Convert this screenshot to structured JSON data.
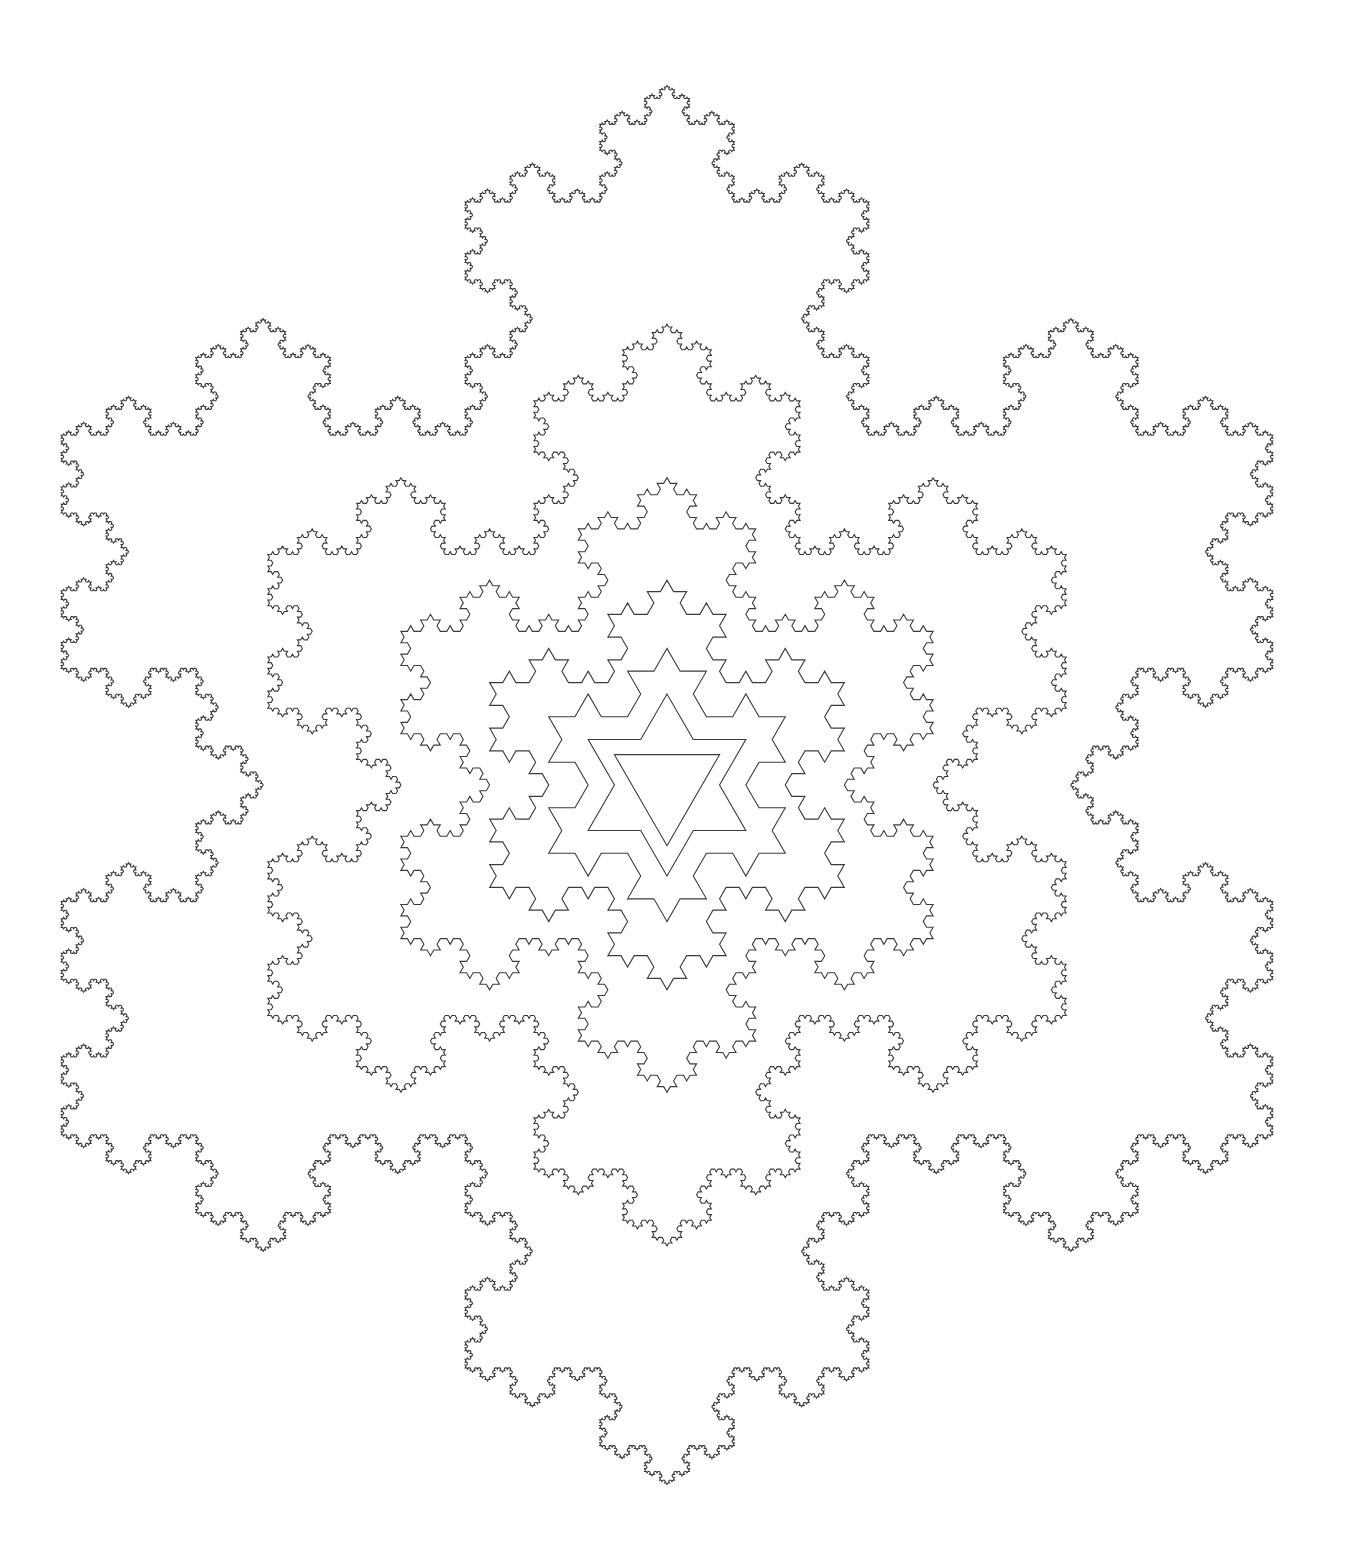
{
  "figure": {
    "width": 1345,
    "height": 1568,
    "background": "#ffffff",
    "stroke_color": "#3c3c3c",
    "stroke_width": 1.1,
    "center": [
      667,
      785
    ],
    "base_orientation": "triangle-pointing-down",
    "scale_per_level": 1.5,
    "base_circumradius": 60.7,
    "levels": [
      {
        "level": 0,
        "name": "triangle",
        "circumradius": 60.7
      },
      {
        "level": 1,
        "name": "hexagram",
        "circumradius": 91
      },
      {
        "level": 2,
        "name": "koch-level-2",
        "circumradius": 136.6
      },
      {
        "level": 3,
        "name": "koch-level-3",
        "circumradius": 204.8
      },
      {
        "level": 4,
        "name": "koch-level-4",
        "circumradius": 307.3
      },
      {
        "level": 5,
        "name": "koch-level-5",
        "circumradius": 460.9
      },
      {
        "level": 6,
        "name": "koch-level-6",
        "circumradius": 699.5
      }
    ]
  }
}
